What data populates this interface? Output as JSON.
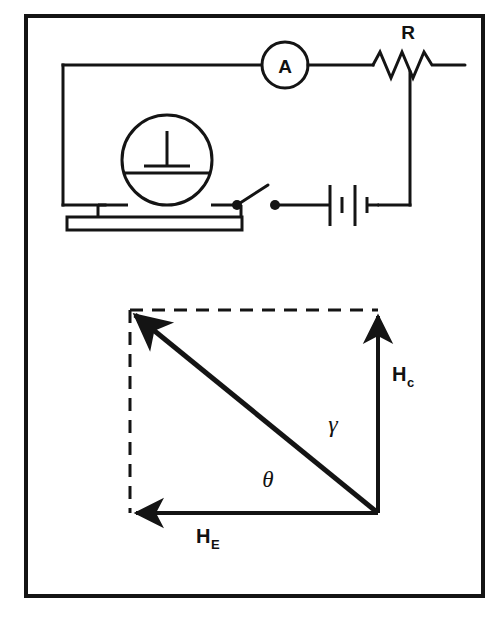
{
  "figure": {
    "kind": "physics-figure",
    "border": {
      "color": "#141414",
      "stroke_width": 4
    },
    "ink_color": "#141414",
    "background": "#ffffff"
  },
  "circuit": {
    "title_visible": false,
    "components": [
      {
        "id": "ammeter",
        "type": "ammeter",
        "label": "A",
        "shape": "circle"
      },
      {
        "id": "resistor",
        "type": "rheostat",
        "label": "R",
        "shape": "zigzag"
      },
      {
        "id": "battery",
        "type": "battery",
        "label": "",
        "cells": 2
      },
      {
        "id": "switch",
        "type": "switch",
        "label": "",
        "state": "open"
      },
      {
        "id": "galvanometer",
        "type": "tangent-galvanometer-coil",
        "label": "",
        "shape": "circle-on-base"
      }
    ],
    "ammeter_label": "A",
    "resistor_label": "R"
  },
  "vector_diagram": {
    "vectors": [
      {
        "id": "h-coil",
        "label": "H",
        "subscript": "c",
        "direction": "up",
        "description": "coil field vertical component"
      },
      {
        "id": "h-earth",
        "label": "H",
        "subscript": "E",
        "direction": "left",
        "description": "earth field horizontal component"
      },
      {
        "id": "h-resultant",
        "label": "",
        "subscript": "",
        "direction": "up-left",
        "description": "resultant field"
      }
    ],
    "angles": [
      {
        "id": "gamma",
        "symbol": "γ"
      },
      {
        "id": "theta",
        "symbol": "θ"
      }
    ],
    "coil_label_main": "H",
    "coil_label_sub": "c",
    "earth_label_main": "H",
    "earth_label_sub": "E",
    "gamma_symbol": "γ",
    "theta_symbol": "θ",
    "dashed_sides": [
      "top",
      "left"
    ]
  }
}
